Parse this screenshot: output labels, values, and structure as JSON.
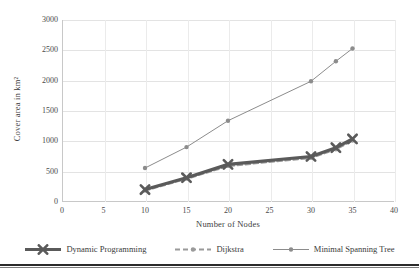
{
  "chart_data": {
    "type": "line",
    "title": "",
    "xlabel": "Number of Nodes",
    "ylabel": "Cover area in km²",
    "xlim": [
      0,
      40
    ],
    "ylim": [
      0,
      3000
    ],
    "xticks": [
      0,
      5,
      10,
      15,
      20,
      25,
      30,
      35,
      40
    ],
    "yticks": [
      0,
      500,
      1000,
      1500,
      2000,
      2500,
      3000
    ],
    "grid": true,
    "legend_position": "bottom",
    "series": [
      {
        "name": "Dynamic Programming",
        "color": "#5a5a5a",
        "marker": "x-thick",
        "linestyle": "solid",
        "x": [
          10,
          15,
          20,
          30,
          33,
          35
        ],
        "values": [
          205,
          400,
          620,
          750,
          895,
          1040
        ]
      },
      {
        "name": "Dijkstra",
        "color": "#9a9a9a",
        "marker": "small-dot",
        "linestyle": "dashed",
        "x": [
          10,
          15,
          20,
          30,
          33,
          35
        ],
        "values": [
          185,
          380,
          590,
          725,
          865,
          1010
        ]
      },
      {
        "name": "Minimal Spanning Tree",
        "color": "#8c8c8c",
        "marker": "small-dot",
        "linestyle": "solid",
        "x": [
          10,
          15,
          20,
          30,
          33,
          35
        ],
        "values": [
          560,
          905,
          1340,
          1990,
          2320,
          2530
        ]
      }
    ]
  },
  "axes": {
    "y_title": "Cover area in km²",
    "x_title": "Number of Nodes",
    "y_tick_labels": [
      "3000",
      "2500",
      "2000",
      "1500",
      "1000",
      "500",
      "0"
    ],
    "x_tick_labels": [
      "0",
      "5",
      "10",
      "15",
      "20",
      "25",
      "30",
      "35",
      "40"
    ]
  },
  "legend": {
    "items": [
      {
        "label": "Dynamic Programming"
      },
      {
        "label": "Dijkstra"
      },
      {
        "label": "Minimal Spanning Tree"
      }
    ]
  },
  "colors": {
    "dynamic_programming": "#5a5a5a",
    "dijkstra": "#9a9a9a",
    "minimal_spanning_tree": "#8c8c8c",
    "grid": "#e3e3e3",
    "axis": "#c8c8c8",
    "text": "#3a3a3a"
  }
}
